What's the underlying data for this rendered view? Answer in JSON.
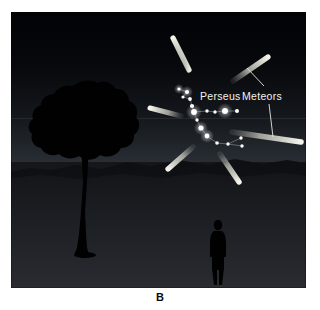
{
  "figure": {
    "caption": "B",
    "scene_title": "Night sky with Perseid meteor shower radiating from Perseus",
    "labels": {
      "constellation": "Perseus",
      "meteors": "Meteors"
    },
    "colors": {
      "sky_top": "#030406",
      "sky_horizon": "#2b3036",
      "ground_near": "#23252a",
      "ground_far": "#15171b",
      "silhouette": "#000000",
      "star": "#ffffff",
      "meteor": "#dcdcd2",
      "label_text": "#f2f2f0",
      "caption_text": "#0a0a0a",
      "page_background": "#ffffff"
    },
    "panel": {
      "x": 11,
      "y": 12,
      "width": 295,
      "height": 276
    },
    "horizon_y": 118,
    "ground_line_y": 168,
    "radiant_point": {
      "x": 196,
      "y": 112
    },
    "stars": [
      {
        "x": 168,
        "y": 77,
        "r": 1.6
      },
      {
        "x": 176,
        "y": 80,
        "r": 2.0
      },
      {
        "x": 172,
        "y": 85,
        "r": 1.6
      },
      {
        "x": 179,
        "y": 87,
        "r": 1.9
      },
      {
        "x": 181,
        "y": 94,
        "r": 2.1
      },
      {
        "x": 183,
        "y": 100,
        "r": 2.9
      },
      {
        "x": 196,
        "y": 99,
        "r": 1.7
      },
      {
        "x": 204,
        "y": 100,
        "r": 1.7
      },
      {
        "x": 214,
        "y": 99,
        "r": 3.0
      },
      {
        "x": 226,
        "y": 99,
        "r": 2.0
      },
      {
        "x": 186,
        "y": 108,
        "r": 1.7
      },
      {
        "x": 190,
        "y": 116,
        "r": 2.6
      },
      {
        "x": 196,
        "y": 124,
        "r": 2.4
      },
      {
        "x": 206,
        "y": 131,
        "r": 1.8
      },
      {
        "x": 217,
        "y": 132,
        "r": 1.7
      },
      {
        "x": 230,
        "y": 126,
        "r": 1.7
      },
      {
        "x": 231,
        "y": 134,
        "r": 1.7
      }
    ],
    "constellation_lines": [
      [
        168,
        77,
        176,
        80
      ],
      [
        176,
        80,
        172,
        85
      ],
      [
        172,
        85,
        179,
        87
      ],
      [
        179,
        87,
        181,
        94
      ],
      [
        181,
        94,
        183,
        100
      ],
      [
        183,
        100,
        196,
        99
      ],
      [
        196,
        99,
        204,
        100
      ],
      [
        204,
        100,
        214,
        99
      ],
      [
        214,
        99,
        226,
        99
      ],
      [
        183,
        100,
        186,
        108
      ],
      [
        186,
        108,
        190,
        116
      ],
      [
        190,
        116,
        196,
        124
      ],
      [
        196,
        124,
        206,
        131
      ],
      [
        206,
        131,
        217,
        132
      ],
      [
        217,
        132,
        230,
        126
      ],
      [
        217,
        132,
        231,
        134
      ]
    ],
    "meteors": [
      {
        "name": "meteor-upper-left",
        "x1": 178,
        "y1": 58,
        "x2": 162,
        "y2": 26,
        "w": 5.2
      },
      {
        "name": "meteor-upper-right",
        "x1": 222,
        "y1": 69,
        "x2": 257,
        "y2": 45,
        "w": 5.2
      },
      {
        "name": "meteor-left",
        "x1": 170,
        "y1": 104,
        "x2": 139,
        "y2": 96,
        "w": 5.0
      },
      {
        "name": "meteor-right",
        "x1": 221,
        "y1": 120,
        "x2": 290,
        "y2": 130,
        "w": 5.6
      },
      {
        "name": "meteor-lower-left",
        "x1": 182,
        "y1": 135,
        "x2": 157,
        "y2": 157,
        "w": 5.2
      },
      {
        "name": "meteor-lower-right",
        "x1": 209,
        "y1": 142,
        "x2": 228,
        "y2": 170,
        "w": 5.4
      }
    ],
    "leader_lines": [
      {
        "name": "leader-to-upper-right-meteor",
        "x1": 256,
        "y1": 77,
        "x2": 237,
        "y2": 57
      },
      {
        "name": "leader-to-right-meteor",
        "x1": 259,
        "y1": 93,
        "x2": 263,
        "y2": 126
      }
    ]
  }
}
